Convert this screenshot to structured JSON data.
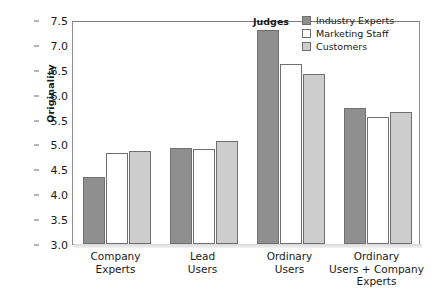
{
  "chart_data": {
    "type": "bar",
    "title": "",
    "xlabel": "",
    "ylabel": "Originality",
    "ylim": [
      3.0,
      7.5
    ],
    "ytick_labels": [
      "7.5",
      "7.0",
      "6.5",
      "6.0",
      "5.5",
      "5.0",
      "4.5",
      "4.0",
      "3.5",
      "3.0"
    ],
    "ytick_values": [
      7.5,
      7.0,
      6.5,
      6.0,
      5.5,
      5.0,
      4.5,
      4.0,
      3.5,
      3.0
    ],
    "grid": false,
    "legend_position": "top-right",
    "legend_title": "Judges",
    "categories": [
      "Company Experts",
      "Lead Users",
      "Ordinary Users",
      "Ordinary Users + Company Experts"
    ],
    "category_lines": [
      [
        "Company",
        "Experts"
      ],
      [
        "Lead",
        "Users"
      ],
      [
        "Ordinary",
        "Users"
      ],
      [
        "Ordinary",
        "Users + Company",
        "Experts"
      ]
    ],
    "series": [
      {
        "name": "Industry Experts",
        "color": "#8f8f8f",
        "values": [
          4.35,
          4.93,
          7.29,
          5.73
        ]
      },
      {
        "name": "Marketing Staff",
        "color": "#ffffff",
        "values": [
          4.83,
          4.91,
          6.61,
          5.56
        ]
      },
      {
        "name": "Customers",
        "color": "#cdcdcd",
        "values": [
          4.86,
          5.07,
          6.42,
          5.65
        ]
      }
    ]
  }
}
